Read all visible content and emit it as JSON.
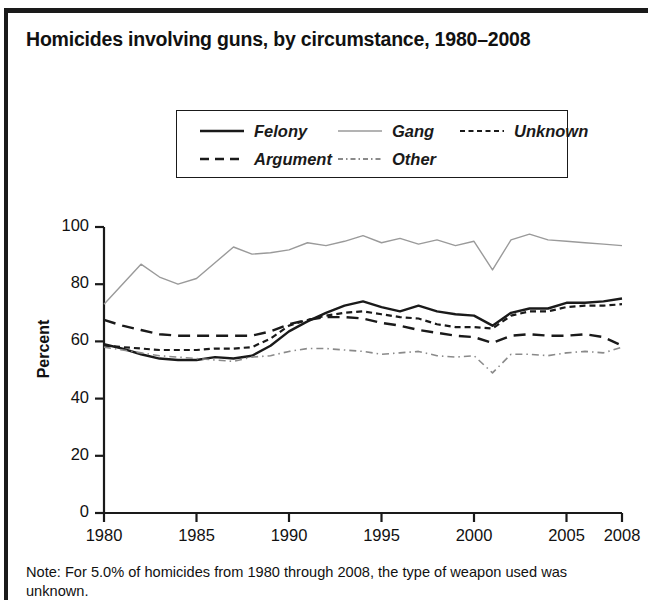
{
  "chart_data": {
    "type": "line",
    "title": "Homicides involving guns, by circumstance, 1980–2008",
    "xlabel": "",
    "ylabel": "Percent",
    "ylim": [
      0,
      100
    ],
    "xlim": [
      1980,
      2008
    ],
    "yticks": [
      0,
      20,
      40,
      60,
      80,
      100
    ],
    "xticks": [
      1980,
      1985,
      1990,
      1995,
      2000,
      2005,
      2008
    ],
    "grid": false,
    "legend_position": "top-center",
    "x": [
      1980,
      1981,
      1982,
      1983,
      1984,
      1985,
      1986,
      1987,
      1988,
      1989,
      1990,
      1991,
      1992,
      1993,
      1994,
      1995,
      1996,
      1997,
      1998,
      1999,
      2000,
      2001,
      2002,
      2003,
      2004,
      2005,
      2006,
      2007,
      2008
    ],
    "series": [
      {
        "name": "Felony",
        "style": "solid",
        "color": "#1a1a1a",
        "width": 2.4,
        "values": [
          59.0,
          57.5,
          55.5,
          54.0,
          53.5,
          53.5,
          54.5,
          54.0,
          55.0,
          58.5,
          63.5,
          67.0,
          70.0,
          72.5,
          74.0,
          72.0,
          70.5,
          72.5,
          70.5,
          69.5,
          69.0,
          65.5,
          70.0,
          71.5,
          71.5,
          73.5,
          73.5,
          74.0,
          75.0
        ]
      },
      {
        "name": "Gang",
        "style": "solid",
        "color": "#9a9a9a",
        "width": 1.4,
        "values": [
          73.0,
          80.0,
          87.0,
          82.5,
          80.0,
          82.0,
          87.5,
          93.0,
          90.5,
          91.0,
          92.0,
          94.5,
          93.5,
          95.0,
          97.0,
          94.5,
          96.0,
          94.0,
          95.5,
          93.5,
          95.0,
          85.0,
          95.5,
          97.5,
          95.5,
          95.0,
          94.5,
          94.0,
          93.5
        ]
      },
      {
        "name": "Unknown",
        "style": "dashed-short",
        "color": "#1a1a1a",
        "width": 2.2,
        "values": [
          58.5,
          58.0,
          57.5,
          57.0,
          57.0,
          57.0,
          57.5,
          57.5,
          58.0,
          61.0,
          65.5,
          67.5,
          69.0,
          70.0,
          70.5,
          69.5,
          68.5,
          68.0,
          66.0,
          65.0,
          65.0,
          64.5,
          69.0,
          70.5,
          70.5,
          72.0,
          72.5,
          72.5,
          73.0
        ]
      },
      {
        "name": "Argument",
        "style": "dashed-long",
        "color": "#1a1a1a",
        "width": 2.4,
        "values": [
          67.5,
          65.5,
          64.0,
          62.5,
          62.0,
          62.0,
          62.0,
          62.0,
          62.0,
          63.5,
          66.0,
          67.5,
          68.5,
          68.5,
          68.0,
          66.5,
          65.5,
          64.0,
          63.0,
          62.0,
          61.5,
          59.5,
          62.0,
          62.5,
          62.0,
          62.0,
          62.5,
          61.5,
          58.5
        ]
      },
      {
        "name": "Other",
        "style": "dash-dot",
        "color": "#8a8a8a",
        "width": 1.6,
        "values": [
          58.0,
          57.0,
          56.0,
          55.0,
          54.5,
          54.0,
          53.5,
          53.0,
          54.5,
          55.0,
          56.5,
          57.5,
          57.5,
          57.0,
          56.5,
          55.5,
          56.0,
          56.5,
          55.0,
          54.5,
          55.0,
          49.0,
          55.5,
          55.5,
          55.0,
          56.0,
          56.5,
          56.0,
          58.0
        ]
      }
    ]
  },
  "note": {
    "text": "Note: For 5.0% of homicides from 1980 through 2008, the type of weapon used was unknown."
  }
}
